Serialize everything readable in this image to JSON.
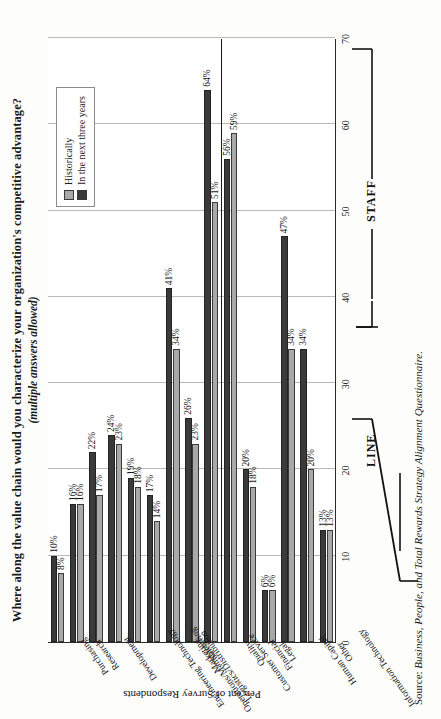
{
  "title": {
    "main": "Where along the value chain would you characterize your organization's competitive advantage?",
    "sub": "(multiple answers allowed)"
  },
  "source": {
    "prefix": "Source:",
    "text": "Business, People, and Total Rewards Strategy Alignment Questionnaire."
  },
  "legend": {
    "position": "top-right",
    "items": [
      {
        "label": "Historically",
        "color": "#a9a9a9"
      },
      {
        "label": "In the next three years",
        "color": "#3a3a3a"
      }
    ]
  },
  "groups": [
    {
      "name": "LINE"
    },
    {
      "name": "STAFF"
    }
  ],
  "chart_data": {
    "type": "bar",
    "title": "Where along the value chain would you characterize your organization's competitive advantage? (multiple answers allowed)",
    "xlabel": "",
    "ylabel": "Percent of Survey Respondents",
    "ylim": [
      0,
      70
    ],
    "yticks": [
      0,
      10,
      20,
      30,
      40,
      50,
      60,
      70
    ],
    "grid": true,
    "orientation": "vertical",
    "categories": [
      "Purchasing",
      "Research",
      "Development",
      "Engineering Technology",
      "Operations/Manufacturing",
      "Logistics/Distribution",
      "Marketing",
      "Sales",
      "Customer Service",
      "Quality",
      "Financial",
      "Legal",
      "Human Capital",
      "Information Technology",
      "Other"
    ],
    "category_groups": [
      "LINE",
      "LINE",
      "LINE",
      "LINE",
      "LINE",
      "LINE",
      "LINE",
      "LINE",
      "LINE",
      "STAFF",
      "STAFF",
      "STAFF",
      "STAFF",
      "STAFF",
      "STAFF"
    ],
    "series": [
      {
        "name": "Historically",
        "color": "#a9a9a9",
        "values": [
          8,
          16,
          17,
          23,
          18,
          14,
          34,
          23,
          51,
          59,
          18,
          6,
          34,
          20,
          13
        ],
        "labels": [
          "8%",
          "16%",
          "17%",
          "23%",
          "18%",
          "14%",
          "34%",
          "23%",
          "51%",
          "59%",
          "18%",
          "6%",
          "34%",
          "20%",
          "13%"
        ]
      },
      {
        "name": "In the next three years",
        "color": "#3a3a3a",
        "values": [
          10,
          16,
          22,
          24,
          19,
          17,
          41,
          26,
          64,
          56,
          20,
          6,
          47,
          34,
          13
        ],
        "labels": [
          "10%",
          "16%",
          "22%",
          "24%",
          "19%",
          "17%",
          "41%",
          "26%",
          "64%",
          "56%",
          "20%",
          "6%",
          "47%",
          "34%",
          "13%"
        ]
      }
    ]
  }
}
